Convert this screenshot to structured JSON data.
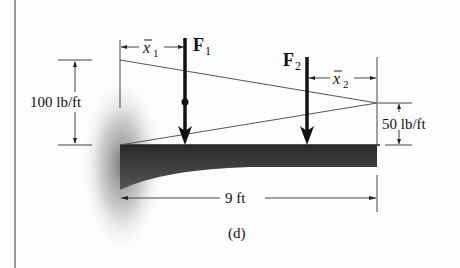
{
  "figure": {
    "caption": "(d)",
    "loads": {
      "left_intensity": "100 lb/ft",
      "right_intensity": "50 lb/ft"
    },
    "forces": [
      {
        "name": "F",
        "subscript": "1",
        "centroid_label": "x",
        "centroid_sub": "1"
      },
      {
        "name": "F",
        "subscript": "2",
        "centroid_label": "x",
        "centroid_sub": "2"
      }
    ],
    "span": "9 ft"
  },
  "colors": {
    "beam": "#3c3c3c",
    "line": "#555555",
    "arrow": "#111111",
    "border": "#9a9a9a"
  }
}
